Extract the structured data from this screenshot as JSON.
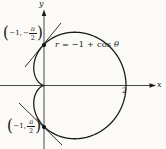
{
  "labels": {
    "equation": {
      "lhs": "r",
      "mid": " = −1 + cos ",
      "theta": "θ"
    },
    "x_axis": "x",
    "y_axis": "y",
    "tick_2": "2",
    "point_top": {
      "open": "(",
      "coords": "−1,",
      "sign": "−",
      "num": "π",
      "den": "2",
      "close": ")"
    },
    "point_bottom": {
      "open": "(",
      "coords": "−1,",
      "sign": "",
      "num": "π",
      "den": "2",
      "close": ")"
    }
  },
  "colors": {
    "ink": "#1c1c1c",
    "paper": "#fbfaf7"
  },
  "chart_data": {
    "type": "line",
    "subtype": "polar-curve",
    "curve_name": "cardioid",
    "equation_label": "r = −1 + cos θ",
    "polar_function": "r(θ) = -1 + cos(θ)",
    "theta_range_radians": [
      0,
      6.2832
    ],
    "axis_labels": {
      "x": "x",
      "y": "y"
    },
    "x_tick_labels": [
      "2"
    ],
    "x_intercepts": [
      0,
      2
    ],
    "cusp_at": [
      0,
      0
    ],
    "max_x": 2,
    "marked_points": [
      {
        "polar_label": "(−1, −π/2)",
        "cartesian": [
          0,
          1
        ],
        "tangent_slope": 1,
        "marker": "filled-dot"
      },
      {
        "polar_label": "(−1, π/2)",
        "cartesian": [
          0,
          -1
        ],
        "tangent_slope": -1,
        "marker": "filled-dot"
      }
    ],
    "tangent_lines_shown": true,
    "grid": false,
    "legend": false
  }
}
